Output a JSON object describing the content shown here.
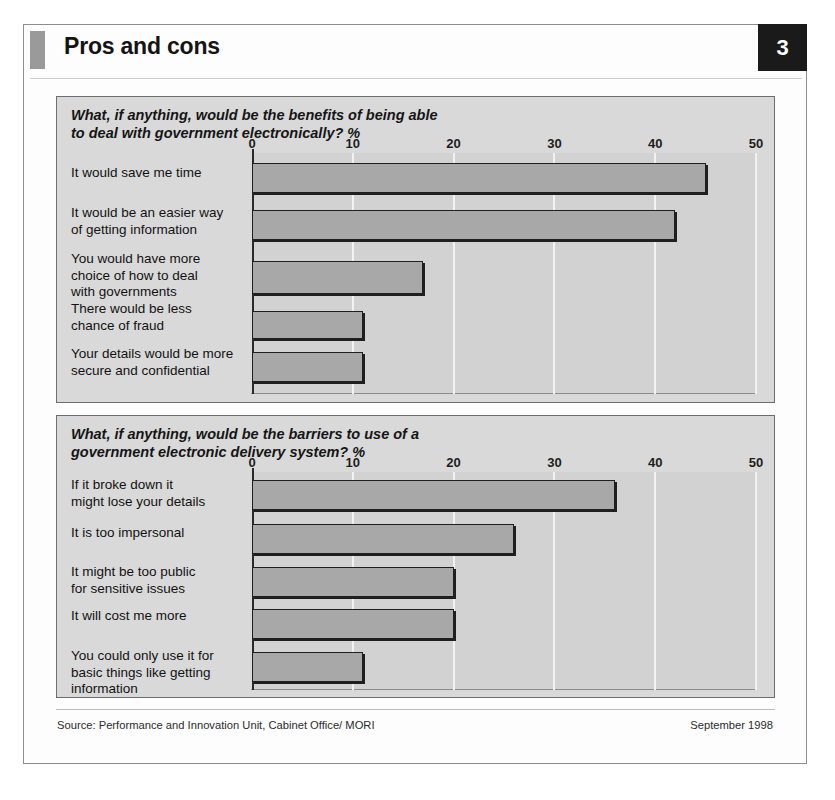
{
  "document": {
    "title": "Pros and cons",
    "page_number": "3",
    "accent_color": "#9a9a9a",
    "panel_bg": "#d9d9d9",
    "plot_bg": "#d2d2d2",
    "bar_fill": "#a8a8a8",
    "bar_stroke": "#1f1f1f"
  },
  "footer": {
    "source": "Source: Performance and Innovation Unit, Cabinet Office/ MORI",
    "date": "September 1998"
  },
  "chart_data": [
    {
      "type": "bar",
      "orientation": "horizontal",
      "title": "What, if anything, would be the benefits of being able\nto deal with government electronically? %",
      "xlabel": "%",
      "ylabel": "",
      "xlim": [
        0,
        50
      ],
      "xticks": [
        0,
        10,
        20,
        30,
        40,
        50
      ],
      "tick_labels": [
        "0",
        "10",
        "20",
        "30",
        "40",
        "50"
      ],
      "grid": true,
      "legend": "none",
      "categories": [
        "It would save me time",
        "It would be an easier way\n  of getting information",
        "You would have more\n  choice of how to deal\n  with governments",
        "There would be less\n  chance of fraud",
        "Your details would be more\n  secure and confidential"
      ],
      "values": [
        45,
        42,
        17,
        11,
        11
      ]
    },
    {
      "type": "bar",
      "orientation": "horizontal",
      "title": "What, if anything, would be the barriers to use of a\ngovernment electronic delivery system? %",
      "xlabel": "%",
      "ylabel": "",
      "xlim": [
        0,
        50
      ],
      "xticks": [
        0,
        10,
        20,
        30,
        40,
        50
      ],
      "tick_labels": [
        "0",
        "10",
        "20",
        "30",
        "40",
        "50"
      ],
      "grid": true,
      "legend": "none",
      "categories": [
        "If it broke down it\n  might lose your details",
        "It is too impersonal",
        "It might be too public\n  for sensitive issues",
        "It will cost me more",
        "You could only use it for\n  basic things like getting\n  information"
      ],
      "values": [
        36,
        26,
        20,
        20,
        11
      ]
    }
  ]
}
